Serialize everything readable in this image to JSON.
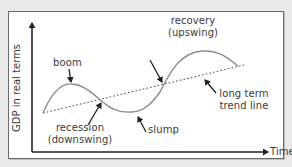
{
  "diagram": {
    "axes": {
      "y_label": "GDP in real terms",
      "x_label": "Time"
    },
    "labels": {
      "boom": "boom",
      "recovery_line1": "recovery",
      "recovery_line2": "(upswing)",
      "recession_line1": "recession",
      "recession_line2": "(downswing)",
      "slump": "slump",
      "trend_line1": "long term",
      "trend_line2": "trend line"
    },
    "colors": {
      "background": "#e9e9e9",
      "panel": "#ffffff",
      "frame": "#6b6b6b",
      "axis": "#222222",
      "curve": "#8a8a8a",
      "trend": "#444444",
      "text": "#3a3a3a"
    },
    "series": {
      "cycle_curve": "actual GDP fluctuating around trend",
      "trend_line": "dotted long term trend line"
    }
  }
}
